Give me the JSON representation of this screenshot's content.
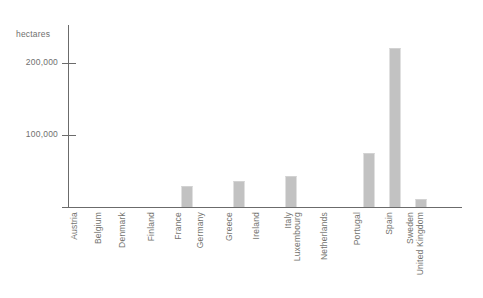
{
  "chart": {
    "unit_caption": "hectares",
    "background_color": "#ffffff",
    "bar_color": "#c2c2c2",
    "axis_color": "#6b6b6b",
    "text_color": "#70706f"
  },
  "chart_data": {
    "type": "bar",
    "title": "",
    "subtitle": "",
    "xlabel": "",
    "ylabel": "hectares",
    "ylim": [
      0,
      253000
    ],
    "grid": false,
    "legend": false,
    "y_ticks": [
      {
        "value": 100000,
        "label": "100,000"
      },
      {
        "value": 200000,
        "label": "200,000"
      }
    ],
    "categories": [
      "Austria",
      "Belgium",
      "Denmark",
      "Finland",
      "France",
      "Germany",
      "Greece",
      "Ireland",
      "Italy",
      "Luxembourg",
      "Netherlands",
      "Portugal",
      "Spain",
      "Sweden",
      "United Kingdom"
    ],
    "values": [
      0,
      0,
      0,
      0,
      29000,
      0,
      36000,
      0,
      43000,
      0,
      0,
      75000,
      221000,
      11000,
      0
    ]
  }
}
